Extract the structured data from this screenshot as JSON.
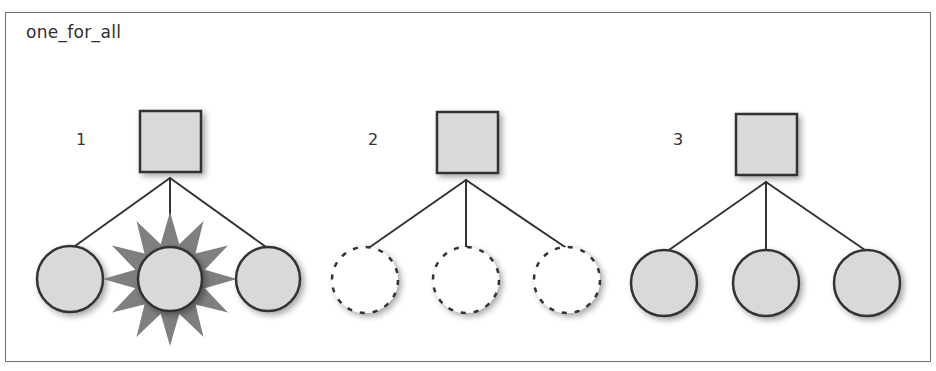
{
  "title": "one_for_all",
  "colors": {
    "frame": "#6e6e6e",
    "stroke": "#333333",
    "fill": "#d9d9d9",
    "burst": "#7f7f7f",
    "background": "#ffffff"
  },
  "groups": [
    {
      "label": "1",
      "label_pos": [
        76,
        132
      ],
      "parent": {
        "shape": "square",
        "x": 140,
        "y": 111,
        "size": 61
      },
      "apex": [
        170,
        178
      ],
      "children": [
        {
          "cx": 70,
          "cy": 279,
          "r": 33,
          "style": "solid"
        },
        {
          "cx": 170,
          "cy": 279,
          "r": 32,
          "style": "solid",
          "highlight": "burst"
        },
        {
          "cx": 268,
          "cy": 279,
          "r": 32,
          "style": "solid"
        }
      ]
    },
    {
      "label": "2",
      "label_pos": [
        368,
        132
      ],
      "parent": {
        "shape": "square",
        "x": 437,
        "y": 112,
        "size": 61
      },
      "apex": [
        466,
        180
      ],
      "children": [
        {
          "cx": 365,
          "cy": 280,
          "r": 33,
          "style": "dashed"
        },
        {
          "cx": 466,
          "cy": 280,
          "r": 33,
          "style": "dashed"
        },
        {
          "cx": 567,
          "cy": 280,
          "r": 33,
          "style": "dashed"
        }
      ]
    },
    {
      "label": "3",
      "label_pos": [
        673,
        132
      ],
      "parent": {
        "shape": "square",
        "x": 736,
        "y": 114,
        "size": 61
      },
      "apex": [
        766,
        182
      ],
      "children": [
        {
          "cx": 664,
          "cy": 283,
          "r": 33,
          "style": "solid"
        },
        {
          "cx": 766,
          "cy": 283,
          "r": 33,
          "style": "solid"
        },
        {
          "cx": 867,
          "cy": 283,
          "r": 33,
          "style": "solid"
        }
      ]
    }
  ]
}
